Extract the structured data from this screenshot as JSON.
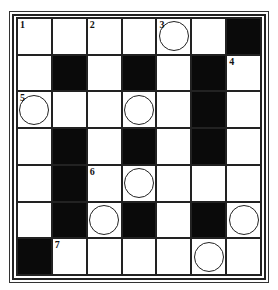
{
  "puzzle": {
    "rows": 7,
    "cols": 7,
    "grid": [
      [
        {
          "n": "1"
        },
        {},
        {
          "n": "2"
        },
        {},
        {
          "n": "3",
          "c": true
        },
        {},
        {
          "b": true
        }
      ],
      [
        {},
        {
          "b": true
        },
        {},
        {
          "b": true
        },
        {},
        {
          "b": true
        },
        {
          "n": "4"
        }
      ],
      [
        {
          "n": "5",
          "c": true
        },
        {},
        {},
        {
          "c": true
        },
        {},
        {
          "b": true
        },
        {}
      ],
      [
        {},
        {
          "b": true
        },
        {},
        {
          "b": true
        },
        {},
        {
          "b": true
        },
        {}
      ],
      [
        {},
        {
          "b": true
        },
        {
          "n": "6"
        },
        {
          "c": true
        },
        {},
        {},
        {}
      ],
      [
        {},
        {
          "b": true
        },
        {
          "c": true
        },
        {
          "b": true
        },
        {},
        {
          "b": true
        },
        {
          "c": true
        }
      ],
      [
        {
          "b": true
        },
        {
          "n": "7"
        },
        {},
        {},
        {},
        {
          "c": true
        },
        {}
      ]
    ]
  }
}
